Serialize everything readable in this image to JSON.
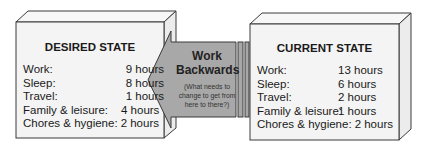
{
  "desired_state": {
    "title": "DESIRED STATE",
    "rows": [
      {
        "label": "Work:",
        "value": "9 hours"
      },
      {
        "label": "Sleep:",
        "value": "8 hours"
      },
      {
        "label": "Travel:",
        "value": "1 hours"
      },
      {
        "label": "Family & leisure:",
        "value": "4 hours"
      },
      {
        "label": "Chores & hygiene:",
        "value": "2 hours"
      }
    ]
  },
  "current_state": {
    "title": "CURRENT STATE",
    "rows": [
      {
        "label": "Work:",
        "value": "13 hours"
      },
      {
        "label": "Sleep:",
        "value": "6 hours"
      },
      {
        "label": "Travel:",
        "value": "2 hours"
      },
      {
        "label": "Family & leisure:",
        "value": "1 hours"
      },
      {
        "label": "Chores & hygiene:",
        "value": "2 hours"
      }
    ]
  },
  "arrow": {
    "title_line1": "Work",
    "title_line2": "Backwards",
    "subtitle_line1": "(What needs to",
    "subtitle_line2": "change to get from",
    "subtitle_line3": "here to there?)"
  },
  "colors": {
    "box_face": "#f4f4f4",
    "box_outline": "#3a3a3a",
    "arrow_fill": "#a8a8a8"
  }
}
